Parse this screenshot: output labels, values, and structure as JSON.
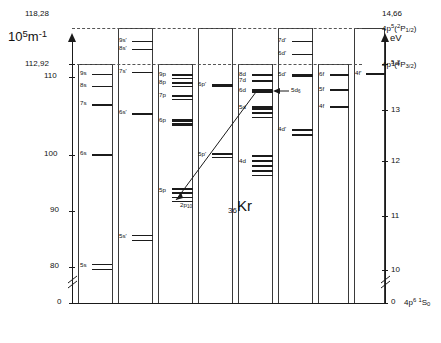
{
  "figure": {
    "element_symbol": "Kr",
    "element_z": "36",
    "ground_config": "4p",
    "ground_config_sup": "6",
    "ground_term_pre": "1",
    "ground_term": "S",
    "ground_term_sub": "0",
    "ground_value_ev": "0"
  },
  "left_axis": {
    "unit_base": "10",
    "unit_exp": "5",
    "unit_rest": "m",
    "unit_rest_exp": "-1",
    "ticks": [
      {
        "label": "118,28",
        "kind": "dashed-limit"
      },
      {
        "label": "112,92",
        "kind": "dashed-limit"
      },
      {
        "label": "110",
        "kind": "tick"
      },
      {
        "label": "100",
        "kind": "tick"
      },
      {
        "label": "90",
        "kind": "tick"
      },
      {
        "label": "80",
        "kind": "tick"
      },
      {
        "label": "0",
        "kind": "tick"
      }
    ]
  },
  "right_axis": {
    "unit": "eV",
    "ticks": [
      {
        "label": "14,66",
        "kind": "dashed-limit"
      },
      {
        "label": "14",
        "kind": "tick"
      },
      {
        "label": "13",
        "kind": "tick"
      },
      {
        "label": "12",
        "kind": "tick"
      },
      {
        "label": "11",
        "kind": "tick"
      },
      {
        "label": "10",
        "kind": "tick"
      },
      {
        "label": "0",
        "kind": "tick"
      }
    ]
  },
  "limits": [
    {
      "id": "upper",
      "config": "4p",
      "config_sup": "5",
      "term_pre": "2",
      "term": "P",
      "term_sub": "1/2",
      "ev": "14,66",
      "cm": "118,28"
    },
    {
      "id": "lower",
      "config": "4p",
      "config_sup": "5",
      "term_pre": "2",
      "term": "P",
      "term_sub": "3/2",
      "ev": "14",
      "cm": "112,92"
    }
  ],
  "columns": [
    {
      "name": "s",
      "levels": [
        {
          "label": "9s",
          "y": 74
        },
        {
          "label": "8s",
          "y": 86
        },
        {
          "label": "7s",
          "y": 104
        },
        {
          "label": "6s",
          "y": 154
        },
        {
          "label": "5s",
          "y": 264
        },
        {
          "label": "",
          "y": 268
        }
      ]
    },
    {
      "name": "s-prime",
      "levels": [
        {
          "label": "9s'",
          "y": 41
        },
        {
          "label": "8s'",
          "y": 49
        },
        {
          "label": "7s'",
          "y": 72
        },
        {
          "label": "6s'",
          "y": 113
        },
        {
          "label": "5s'",
          "y": 235
        },
        {
          "label": "",
          "y": 239
        }
      ]
    },
    {
      "name": "p",
      "levels": [
        {
          "label": "9p",
          "y": 75
        },
        {
          "label": "",
          "y": 78
        },
        {
          "label": "8p",
          "y": 82
        },
        {
          "label": "",
          "y": 85
        },
        {
          "label": "7p",
          "y": 95
        },
        {
          "label": "",
          "y": 99
        },
        {
          "label": "6p",
          "y": 120
        },
        {
          "label": "",
          "y": 123
        },
        {
          "label": "",
          "y": 126
        },
        {
          "label": "5p",
          "y": 189
        },
        {
          "label": "",
          "y": 192
        },
        {
          "label": "",
          "y": 196
        },
        {
          "label": "",
          "y": 200
        }
      ]
    },
    {
      "name": "p-prime",
      "levels": [
        {
          "label": "6p'",
          "y": 84
        },
        {
          "label": "5p'",
          "y": 154
        },
        {
          "label": "",
          "y": 157
        }
      ]
    },
    {
      "name": "d",
      "levels": [
        {
          "label": "8d",
          "y": 74
        },
        {
          "label": "7d",
          "y": 80
        },
        {
          "label": "6d",
          "y": 90
        },
        {
          "label": "5d",
          "y": 107
        },
        {
          "label": "",
          "y": 111
        },
        {
          "label": "4d",
          "y": 160
        },
        {
          "label": "",
          "y": 164
        },
        {
          "label": "",
          "y": 168
        }
      ]
    },
    {
      "name": "d-prime",
      "levels": [
        {
          "label": "7d'",
          "y": 41
        },
        {
          "label": "6d'",
          "y": 54
        },
        {
          "label": "5d'",
          "y": 75
        },
        {
          "label": "4d'",
          "y": 130
        },
        {
          "label": "",
          "y": 134
        }
      ]
    },
    {
      "name": "f",
      "levels": [
        {
          "label": "6f",
          "y": 74
        },
        {
          "label": "5f",
          "y": 89
        },
        {
          "label": "4f",
          "y": 106
        }
      ]
    },
    {
      "name": "f-prime",
      "levels": [
        {
          "label": "4f'",
          "y": 73
        }
      ]
    }
  ],
  "annotations": [
    {
      "name": "transition-label-5d6",
      "text": "5d",
      "sub": "6"
    },
    {
      "name": "transition-label-2p10",
      "text": "2p",
      "sub": "10"
    }
  ]
}
